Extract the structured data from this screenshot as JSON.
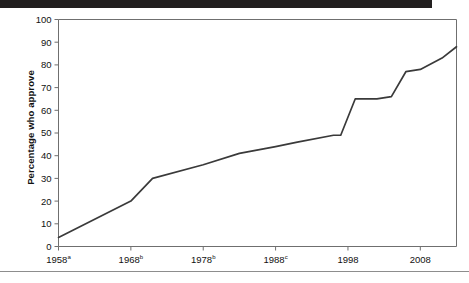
{
  "figure": {
    "header_band_color": "#221f1f",
    "footer_rule_color": "#8d8d8d",
    "axis_color": "#6f6f6f",
    "line_color": "#3a3a3a"
  },
  "chart_data": {
    "type": "line",
    "title": "",
    "xlabel": "",
    "ylabel": "Percentage who approve",
    "ylim": [
      0,
      100
    ],
    "xlim": [
      1958,
      2013
    ],
    "grid": false,
    "legend": null,
    "y_ticks": [
      0,
      10,
      20,
      30,
      40,
      50,
      60,
      70,
      80,
      90,
      100
    ],
    "y_tick_labels": [
      "0",
      "10",
      "20",
      "30",
      "40",
      "50",
      "60",
      "70",
      "80",
      "90",
      "100"
    ],
    "x_ticks": [
      1958,
      1968,
      1978,
      1988,
      1998,
      2008
    ],
    "x_tick_labels": [
      "1958",
      "1968",
      "1978",
      "1988",
      "1998",
      "2008"
    ],
    "x_tick_superscripts": [
      "a",
      "b",
      "b",
      "c",
      "",
      ""
    ],
    "series": [
      {
        "name": "Percentage who approve",
        "x": [
          1958,
          1968,
          1971,
          1978,
          1983,
          1988,
          1991,
          1996,
          1997,
          1999,
          2002,
          2004,
          2006,
          2008,
          2011,
          2013
        ],
        "values": [
          4,
          20,
          30,
          36,
          41,
          44,
          46,
          49,
          49,
          65,
          65,
          66,
          77,
          78,
          83,
          88
        ]
      }
    ]
  }
}
